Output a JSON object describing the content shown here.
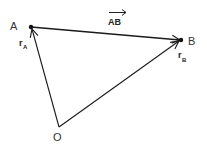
{
  "diagram": {
    "type": "vector-triangle",
    "colors": {
      "line": "#1a1a1a",
      "text": "#333333",
      "background": "#ffffff"
    },
    "points": {
      "A": {
        "label": "A",
        "x": 31,
        "y": 27
      },
      "B": {
        "label": "B",
        "x": 181,
        "y": 40
      },
      "O": {
        "label": "O",
        "x": 59,
        "y": 127
      }
    },
    "vectors": [
      {
        "id": "AB",
        "from": "A",
        "to": "B",
        "label": "AB",
        "overarrow": true
      },
      {
        "id": "rA",
        "from": "O",
        "to": "A",
        "label_main": "r",
        "label_sub": "A"
      },
      {
        "id": "rB",
        "from": "O",
        "to": "B",
        "label_main": "r",
        "label_sub": "B"
      }
    ]
  }
}
